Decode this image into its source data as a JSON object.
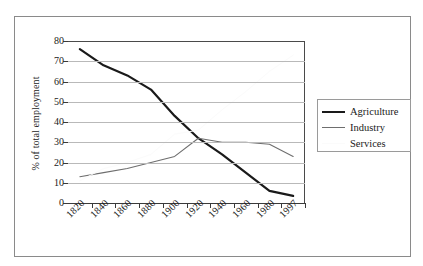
{
  "figure": {
    "background_color": "#ffffff",
    "frame_color": "#8a8a8a"
  },
  "chart_data": {
    "type": "line",
    "title": "",
    "xlabel": "",
    "ylabel": "% of total employment",
    "ylim": [
      0,
      80
    ],
    "yticks": [
      0,
      10,
      20,
      30,
      40,
      50,
      60,
      70,
      80
    ],
    "ytick_labels": [
      "0",
      "10",
      "20",
      "30",
      "40",
      "50",
      "60",
      "70",
      "80"
    ],
    "grid": true,
    "grid_axis": "y",
    "legend_position": "right",
    "categories": [
      "1820",
      "1840",
      "1860",
      "1880",
      "1900",
      "1920",
      "1940",
      "1960",
      "1980",
      "1997"
    ],
    "x": [
      1820,
      1840,
      1860,
      1880,
      1900,
      1920,
      1940,
      1960,
      1980,
      1997
    ],
    "series": [
      {
        "name": "Agriculture",
        "color": "#1a1a1a",
        "line_width": 2.2,
        "values": [
          76,
          68,
          63,
          56,
          43,
          32,
          24,
          15,
          6,
          3.5
        ]
      },
      {
        "name": "Industry",
        "color": "#6e6e6e",
        "line_width": 1.1,
        "values": [
          13,
          15,
          17,
          20,
          23,
          32,
          30,
          30,
          29,
          23
        ]
      },
      {
        "name": "Services",
        "color": "#fbfbfb",
        "line_width": 1.0,
        "values": [
          11,
          17,
          20,
          24,
          34,
          36,
          46,
          55,
          65,
          73
        ]
      }
    ]
  },
  "legend": {
    "entries": [
      {
        "label": "Agriculture"
      },
      {
        "label": "Industry"
      },
      {
        "label": "Services"
      }
    ]
  }
}
